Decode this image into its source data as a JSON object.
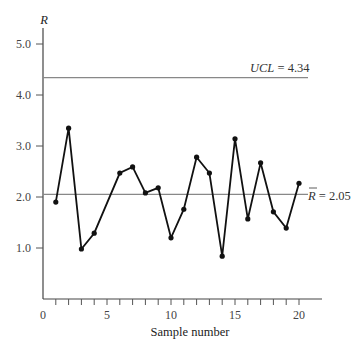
{
  "chart_data": {
    "type": "line",
    "title": "",
    "xlabel": "Sample number",
    "ylabel": "R",
    "xlim": [
      0,
      21.5
    ],
    "ylim": [
      0,
      5.2
    ],
    "grid": false,
    "x_ticks": [
      0,
      5,
      10,
      15,
      20
    ],
    "x_minor_ticks": [
      1,
      2,
      3,
      4,
      6,
      7,
      8,
      9,
      11,
      12,
      13,
      14,
      16,
      17,
      18,
      19
    ],
    "y_ticks": [
      1.0,
      2.0,
      3.0,
      4.0,
      5.0
    ],
    "y_tick_labels": [
      "1.0",
      "2.0",
      "3.0",
      "4.0",
      "5.0"
    ],
    "x_tick_labels": [
      "0",
      "5",
      "10",
      "15",
      "20"
    ],
    "series": [
      {
        "name": "Range",
        "x": [
          1,
          2,
          3,
          4,
          6,
          7,
          8,
          9,
          10,
          11,
          12,
          13,
          14,
          15,
          16,
          17,
          18,
          19,
          20
        ],
        "values": [
          1.9,
          3.35,
          0.98,
          1.29,
          2.47,
          2.59,
          2.08,
          2.18,
          1.2,
          1.76,
          2.78,
          2.47,
          0.84,
          3.14,
          1.57,
          2.67,
          1.71,
          1.39,
          2.27
        ]
      }
    ],
    "reference_lines": [
      {
        "name": "UCL",
        "value": 4.34,
        "label_var": "UCL",
        "label_eq": " = 4.34"
      },
      {
        "name": "R-bar",
        "value": 2.05,
        "label_var": "R",
        "label_eq": " = 2.05"
      }
    ]
  },
  "labels": {
    "y_axis_symbol": "R",
    "x_axis_title": "Sample number",
    "ucl_var": "UCL",
    "ucl_eq": " = 4.34",
    "rbar_var": "R",
    "rbar_eq": " = 2.05"
  }
}
